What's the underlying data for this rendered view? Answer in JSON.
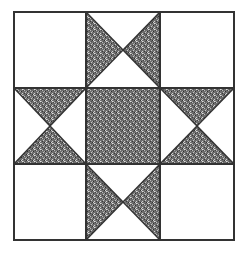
{
  "diagram": {
    "type": "quilt-block",
    "name": "Ohio Star",
    "grid": 3,
    "colors": {
      "background": "#ffffff",
      "line": "#333333",
      "fill_dark": "#4a4a4a",
      "fill_light": "#9a9a9a"
    },
    "cells": [
      {
        "row": 0,
        "col": 0,
        "kind": "plain"
      },
      {
        "row": 0,
        "col": 1,
        "kind": "hourglass-vertical",
        "shaded": [
          "left",
          "right"
        ]
      },
      {
        "row": 0,
        "col": 2,
        "kind": "plain"
      },
      {
        "row": 1,
        "col": 0,
        "kind": "hourglass-horizontal",
        "shaded": [
          "top",
          "bottom"
        ]
      },
      {
        "row": 1,
        "col": 1,
        "kind": "solid-shaded"
      },
      {
        "row": 1,
        "col": 2,
        "kind": "hourglass-horizontal",
        "shaded": [
          "top",
          "bottom"
        ]
      },
      {
        "row": 2,
        "col": 0,
        "kind": "plain"
      },
      {
        "row": 2,
        "col": 1,
        "kind": "hourglass-vertical",
        "shaded": [
          "left",
          "right"
        ]
      },
      {
        "row": 2,
        "col": 2,
        "kind": "plain"
      }
    ]
  }
}
